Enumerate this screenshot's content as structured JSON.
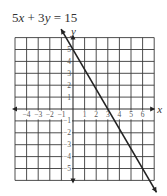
{
  "chart_data": {
    "type": "line",
    "title": "5x + 3y = 15",
    "xlabel": "x",
    "ylabel": "y",
    "xlim": [
      -5,
      7
    ],
    "ylim": [
      -6,
      6
    ],
    "grid": true,
    "x_tick_labels": [
      "-4",
      "-3",
      "-2",
      "-1",
      "1",
      "2",
      "3",
      "4",
      "5",
      "6"
    ],
    "y_tick_labels": [
      "5",
      "4",
      "3",
      "2",
      "1",
      "-1",
      "-2",
      "-3",
      "-4",
      "-5"
    ],
    "series": [
      {
        "name": "5x + 3y = 15",
        "equation": "5x + 3y = 15",
        "slope": -1.6667,
        "y_intercept": 5,
        "x_intercept": 3,
        "x": [
          -1,
          0,
          3,
          6,
          7.2
        ],
        "y": [
          6.67,
          5,
          0,
          -5,
          -7
        ],
        "arrows": "both"
      }
    ],
    "legend": "none"
  },
  "title": {
    "parts": [
      "5",
      "x",
      " + 3",
      "y",
      " = 15"
    ]
  },
  "axes": {
    "x_label": "x",
    "y_label": "y"
  },
  "colors": {
    "grid": "#3a3a3a",
    "line": "#222222",
    "background": "#ffffff"
  }
}
